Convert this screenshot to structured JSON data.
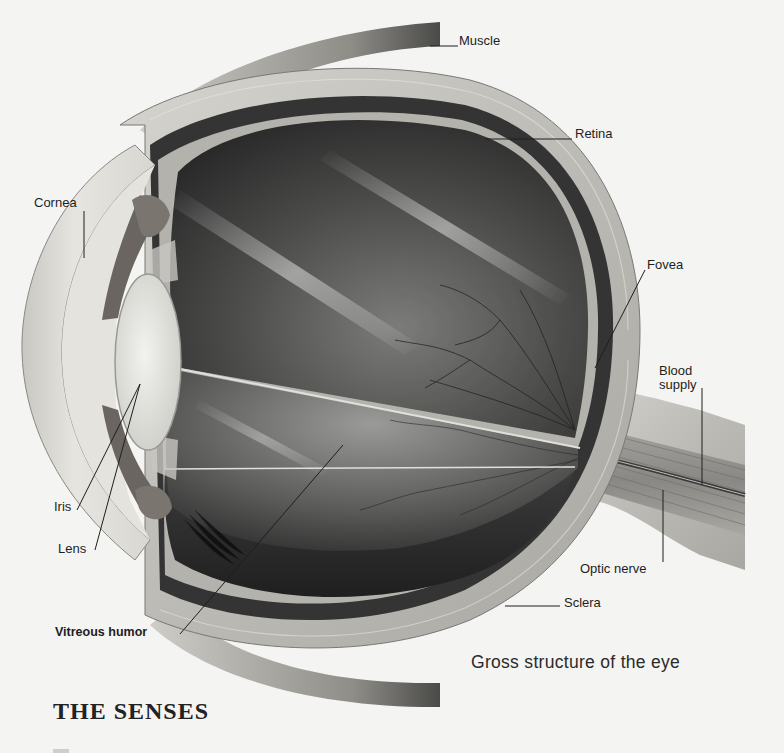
{
  "figure": {
    "caption": "Gross structure of the eye",
    "labels": [
      {
        "id": "muscle",
        "text": "Muscle"
      },
      {
        "id": "retina",
        "text": "Retina"
      },
      {
        "id": "cornea",
        "text": "Cornea"
      },
      {
        "id": "fovea",
        "text": "Fovea"
      },
      {
        "id": "blood_supply",
        "text": "Blood\nsupply",
        "line1": "Blood",
        "line2": "supply"
      },
      {
        "id": "iris",
        "text": "Iris"
      },
      {
        "id": "lens",
        "text": "Lens"
      },
      {
        "id": "optic_nerve",
        "text": "Optic nerve"
      },
      {
        "id": "sclera",
        "text": "Sclera"
      },
      {
        "id": "vitreous_humor",
        "text": "Vitreous humor"
      }
    ]
  },
  "section": {
    "heading": "THE SENSES"
  },
  "colors": {
    "background": "#f4f4f2",
    "sclera": "#b8b6b0",
    "choroid": "#3a3a3a",
    "interior_dark": "#2e2e2e",
    "interior_light": "#8a8a88",
    "lens": "#e6e6e2",
    "iris": "#6a6560",
    "label_text": "#1e1e1e"
  }
}
